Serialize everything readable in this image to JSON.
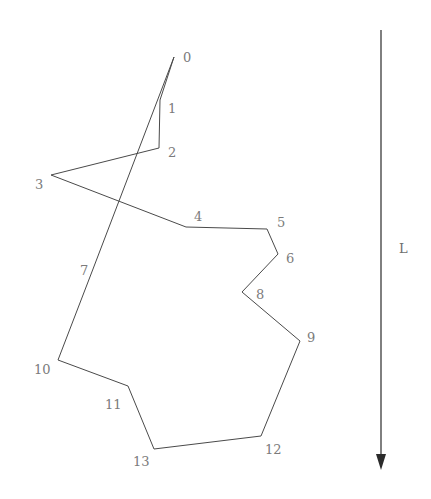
{
  "figure": {
    "type": "polygon-diagram",
    "background_color": "#ffffff",
    "outline_color": "#4a4a4a",
    "label_color": "#7b7b7b",
    "width": 431,
    "height": 499,
    "polygon": {
      "name": "closed-polygon",
      "closed": true,
      "stroke_width": 1,
      "vertices": [
        {
          "id": "0",
          "x": 174,
          "y": 57,
          "label": "0",
          "label_x": 183,
          "label_y": 51
        },
        {
          "id": "1",
          "x": 160,
          "y": 100,
          "label": "1",
          "label_x": 168,
          "label_y": 102
        },
        {
          "id": "2",
          "x": 159,
          "y": 148,
          "label": "2",
          "label_x": 168,
          "label_y": 146
        },
        {
          "id": "3",
          "x": 51,
          "y": 175,
          "label": "3",
          "label_x": 35,
          "label_y": 178
        },
        {
          "id": "4",
          "x": 186,
          "y": 227,
          "label": "4",
          "label_x": 194,
          "label_y": 210
        },
        {
          "id": "5",
          "x": 267,
          "y": 229,
          "label": "5",
          "label_x": 277,
          "label_y": 216
        },
        {
          "id": "6",
          "x": 278,
          "y": 254,
          "label": "6",
          "label_x": 286,
          "label_y": 252
        },
        {
          "id": "8",
          "x": 242,
          "y": 292,
          "label": "8",
          "label_x": 256,
          "label_y": 288
        },
        {
          "id": "9",
          "x": 300,
          "y": 341,
          "label": "9",
          "label_x": 307,
          "label_y": 331
        },
        {
          "id": "12",
          "x": 261,
          "y": 436,
          "label": "12",
          "label_x": 265,
          "label_y": 443
        },
        {
          "id": "13",
          "x": 154,
          "y": 449,
          "label": "13",
          "label_x": 133,
          "label_y": 455
        },
        {
          "id": "11",
          "x": 128,
          "y": 386,
          "label": "11",
          "label_x": 105,
          "label_y": 398
        },
        {
          "id": "10",
          "x": 58,
          "y": 360,
          "label": "10",
          "label_x": 34,
          "label_y": 363
        },
        {
          "id": "7",
          "x": 93,
          "y": 269,
          "label": "7",
          "label_x": 80,
          "label_y": 264
        }
      ]
    },
    "axis_arrow": {
      "name": "downward-direction-arrow",
      "x": 381,
      "y_start": 30,
      "y_end": 470,
      "color": "#2b2b2b",
      "label": "L",
      "label_x": 399,
      "label_y": 242
    }
  }
}
